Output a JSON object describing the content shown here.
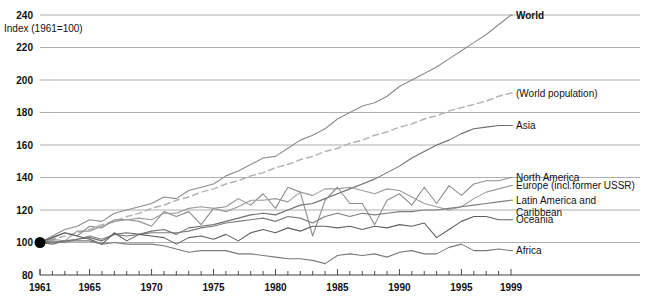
{
  "chart_data": {
    "type": "line",
    "title": "",
    "subtitle": "",
    "xlabel": "",
    "ylabel": "Index (1961=100)",
    "ylim": [
      80,
      240
    ],
    "xlim": [
      1961,
      1999
    ],
    "grid": true,
    "legend_position": "right-inline",
    "y_ticks": [
      240,
      220,
      200,
      180,
      160,
      140,
      120,
      100,
      80
    ],
    "x_ticks": [
      1961,
      1965,
      1970,
      1975,
      1980,
      1985,
      1990,
      1995,
      1999
    ],
    "x_tick_all_years": true,
    "annotations": [
      {
        "text": "Index (1961=100)",
        "x": 1961,
        "y": 232
      },
      {
        "text": "origin marker at 1961 = 100",
        "x": 1961,
        "y": 100
      }
    ],
    "x": [
      1961,
      1962,
      1963,
      1964,
      1965,
      1966,
      1967,
      1968,
      1969,
      1970,
      1971,
      1972,
      1973,
      1974,
      1975,
      1976,
      1977,
      1978,
      1979,
      1980,
      1981,
      1982,
      1983,
      1984,
      1985,
      1986,
      1987,
      1988,
      1989,
      1990,
      1991,
      1992,
      1993,
      1994,
      1995,
      1996,
      1997,
      1998,
      1999
    ],
    "series": [
      {
        "name": "World",
        "label": "World",
        "color": "#8c8c8c",
        "style": "solid",
        "bold_label": true,
        "end_value": 240,
        "values": [
          100,
          104,
          108,
          110,
          114,
          113,
          118,
          120,
          122,
          124,
          128,
          127,
          132,
          134,
          136,
          141,
          144,
          148,
          152,
          153,
          158,
          163,
          166,
          170,
          176,
          180,
          184,
          186,
          190,
          196,
          200,
          204,
          208,
          213,
          218,
          223,
          228,
          234,
          240
        ]
      },
      {
        "name": "World population",
        "label": "(World population)",
        "color": "#b4b4b4",
        "style": "dashed",
        "bold_label": false,
        "end_value": 192,
        "values": [
          100,
          102,
          104,
          106,
          108,
          111,
          113,
          116,
          118,
          121,
          123,
          126,
          128,
          131,
          133,
          136,
          138,
          141,
          143,
          146,
          148,
          151,
          153,
          156,
          158,
          161,
          163,
          166,
          168,
          171,
          173,
          176,
          178,
          181,
          183,
          185,
          187,
          190,
          192
        ]
      },
      {
        "name": "Asia",
        "label": "Asia",
        "color": "#6e6e6e",
        "style": "solid",
        "bold_label": false,
        "end_value": 172,
        "values": [
          100,
          99,
          101,
          102,
          103,
          101,
          105,
          106,
          105,
          107,
          108,
          105,
          109,
          110,
          111,
          113,
          115,
          117,
          118,
          117,
          120,
          123,
          124,
          127,
          130,
          133,
          136,
          139,
          143,
          147,
          152,
          156,
          160,
          163,
          167,
          170,
          171,
          172,
          172
        ]
      },
      {
        "name": "North America",
        "label": "North America",
        "color": "#8f8f8f",
        "style": "solid",
        "bold_label": false,
        "end_value": 140,
        "values": [
          100,
          103,
          106,
          104,
          110,
          109,
          114,
          114,
          113,
          110,
          119,
          116,
          119,
          111,
          121,
          122,
          127,
          123,
          130,
          121,
          134,
          131,
          104,
          126,
          134,
          124,
          124,
          111,
          126,
          130,
          123,
          134,
          124,
          135,
          129,
          136,
          138,
          138,
          140
        ]
      },
      {
        "name": "Europe (incl.former USSR)",
        "label": "Europe (incl.former USSR)",
        "color": "#9b9b9b",
        "style": "solid",
        "bold_label": false,
        "end_value": 135,
        "values": [
          100,
          102,
          101,
          107,
          107,
          110,
          113,
          114,
          115,
          114,
          118,
          118,
          121,
          122,
          121,
          119,
          122,
          126,
          126,
          127,
          125,
          131,
          129,
          133,
          133,
          134,
          132,
          130,
          133,
          132,
          128,
          124,
          122,
          120,
          122,
          127,
          131,
          133,
          135
        ]
      },
      {
        "name": "Latin America and Caribbean",
        "label": "Latin America and",
        "label2": "Caribbean",
        "color": "#7d7d7d",
        "style": "solid",
        "bold_label": false,
        "end_value": 126,
        "values": [
          100,
          101,
          100,
          102,
          104,
          102,
          105,
          104,
          105,
          106,
          106,
          106,
          107,
          109,
          110,
          112,
          113,
          114,
          115,
          113,
          116,
          115,
          112,
          116,
          118,
          116,
          118,
          117,
          118,
          119,
          119,
          120,
          120,
          121,
          122,
          123,
          124,
          125,
          126
        ]
      },
      {
        "name": "Oceania",
        "label": "Oceania",
        "color": "#606060",
        "style": "solid",
        "bold_label": false,
        "end_value": 114,
        "values": [
          100,
          103,
          106,
          104,
          102,
          99,
          106,
          101,
          105,
          104,
          103,
          99,
          103,
          104,
          102,
          105,
          101,
          106,
          108,
          106,
          109,
          107,
          110,
          110,
          109,
          110,
          108,
          110,
          109,
          111,
          110,
          112,
          103,
          108,
          113,
          116,
          116,
          114,
          114
        ]
      },
      {
        "name": "Africa",
        "label": "Africa",
        "color": "#7a7a7a",
        "style": "solid",
        "bold_label": false,
        "end_value": 95,
        "values": [
          100,
          100,
          101,
          101,
          101,
          99,
          100,
          99,
          99,
          99,
          98,
          96,
          94,
          95,
          95,
          95,
          93,
          93,
          92,
          91,
          90,
          90,
          89,
          87,
          92,
          93,
          92,
          93,
          91,
          94,
          95,
          93,
          93,
          97,
          99,
          95,
          95,
          96,
          95
        ]
      }
    ]
  },
  "footer": {
    "cropped_caption": ""
  }
}
